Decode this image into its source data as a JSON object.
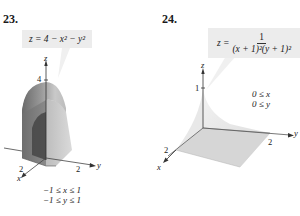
{
  "figures": [
    {
      "number": "23.",
      "equation": "z = 4 − x² − y²",
      "axis_labels": {
        "z": "z",
        "x": "x",
        "y": "y"
      },
      "ticks": {
        "z": "4",
        "x": "2",
        "y": "2"
      },
      "domain": [
        "−1 ≤ x ≤ 1",
        "−1 ≤ y ≤ 1"
      ]
    },
    {
      "number": "24.",
      "equation_lhs": "z =",
      "equation_numerator": "1",
      "equation_denominator": "(x + 1)²(y + 1)²",
      "axis_labels": {
        "z": "z",
        "x": "x",
        "y": "y"
      },
      "ticks": {
        "z": "1",
        "x": "2",
        "y": "2"
      },
      "domain": [
        "0 ≤ x",
        "0 ≤ y"
      ]
    }
  ],
  "colors": {
    "equation_bg": "#ececec",
    "surface_dark": "#5a5a5a",
    "surface_mid": "#9a9a9a",
    "surface_light": "#d0d0d0",
    "plane_fill": "#d8d8d8"
  }
}
